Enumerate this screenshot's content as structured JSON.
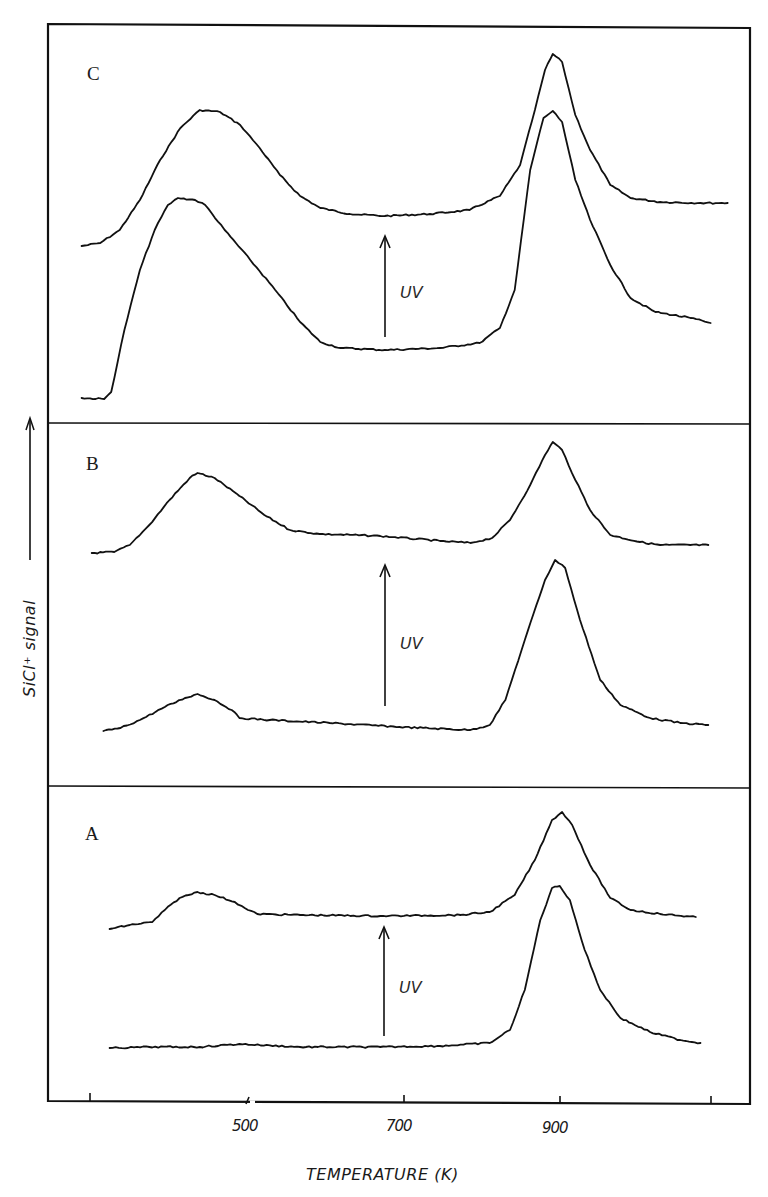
{
  "chart_data": {
    "type": "line",
    "title": "",
    "xlabel": "TEMPERATURE (K)",
    "ylabel": "SiCl⁺ signal",
    "ylabel_arrow": "up",
    "xlim": [
      250,
      1130
    ],
    "x_ticks": [
      300,
      500,
      700,
      900,
      1100
    ],
    "x_tick_labels": [
      "",
      "500",
      "700",
      "900",
      ""
    ],
    "x_axis_break_at": 500,
    "y_units": "arbitrary (offset traces, panel-relative)",
    "grid": false,
    "legend": null,
    "panels": [
      {
        "label": "C",
        "annotation": "UV",
        "annotation_arrow": {
          "T": 680,
          "from": 0.87,
          "to": 1.86
        },
        "series": [
          {
            "name": "C after UV (upper trace)",
            "points": [
              [
                286,
                1.77
              ],
              [
                310,
                1.8
              ],
              [
                335,
                1.93
              ],
              [
                361,
                2.23
              ],
              [
                387,
                2.63
              ],
              [
                413,
                2.95
              ],
              [
                438,
                3.13
              ],
              [
                464,
                3.11
              ],
              [
                490,
                2.98
              ],
              [
                515,
                2.75
              ],
              [
                541,
                2.48
              ],
              [
                567,
                2.27
              ],
              [
                593,
                2.15
              ],
              [
                631,
                2.09
              ],
              [
                676,
                2.07
              ],
              [
                734,
                2.09
              ],
              [
                785,
                2.13
              ],
              [
                824,
                2.27
              ],
              [
                850,
                2.58
              ],
              [
                869,
                3.13
              ],
              [
                882,
                3.53
              ],
              [
                892,
                3.69
              ],
              [
                904,
                3.61
              ],
              [
                921,
                3.08
              ],
              [
                940,
                2.73
              ],
              [
                966,
                2.38
              ],
              [
                992,
                2.25
              ],
              [
                1030,
                2.21
              ],
              [
                1082,
                2.2
              ],
              [
                1117,
                2.2
              ]
            ]
          },
          {
            "name": "C before UV (lower trace)",
            "points": [
              [
                286,
                0.25
              ],
              [
                315,
                0.24
              ],
              [
                324,
                0.31
              ],
              [
                341,
                0.93
              ],
              [
                361,
                1.53
              ],
              [
                380,
                1.93
              ],
              [
                397,
                2.18
              ],
              [
                410,
                2.25
              ],
              [
                432,
                2.23
              ],
              [
                445,
                2.18
              ],
              [
                470,
                1.93
              ],
              [
                503,
                1.63
              ],
              [
                535,
                1.33
              ],
              [
                567,
                1.01
              ],
              [
                593,
                0.81
              ],
              [
                619,
                0.75
              ],
              [
                676,
                0.73
              ],
              [
                747,
                0.75
              ],
              [
                798,
                0.8
              ],
              [
                824,
                0.95
              ],
              [
                843,
                1.33
              ],
              [
                863,
                2.53
              ],
              [
                880,
                3.05
              ],
              [
                892,
                3.12
              ],
              [
                904,
                3.01
              ],
              [
                921,
                2.43
              ],
              [
                940,
                2.03
              ],
              [
                966,
                1.58
              ],
              [
                992,
                1.25
              ],
              [
                1024,
                1.11
              ],
              [
                1069,
                1.05
              ],
              [
                1095,
                1.0
              ]
            ]
          }
        ]
      },
      {
        "label": "B",
        "annotation": "UV",
        "annotation_arrow": {
          "T": 680,
          "from": 0.81,
          "to": 2.22
        },
        "series": [
          {
            "name": "B after UV (upper trace)",
            "points": [
              [
                299,
                2.34
              ],
              [
                328,
                2.35
              ],
              [
                348,
                2.42
              ],
              [
                373,
                2.62
              ],
              [
                399,
                2.87
              ],
              [
                425,
                3.09
              ],
              [
                435,
                3.14
              ],
              [
                457,
                3.09
              ],
              [
                489,
                2.91
              ],
              [
                521,
                2.72
              ],
              [
                554,
                2.57
              ],
              [
                592,
                2.53
              ],
              [
                670,
                2.51
              ],
              [
                747,
                2.46
              ],
              [
                786,
                2.44
              ],
              [
                814,
                2.49
              ],
              [
                837,
                2.67
              ],
              [
                863,
                3.02
              ],
              [
                882,
                3.32
              ],
              [
                892,
                3.45
              ],
              [
                904,
                3.37
              ],
              [
                921,
                3.07
              ],
              [
                940,
                2.77
              ],
              [
                966,
                2.52
              ],
              [
                1004,
                2.45
              ],
              [
                1030,
                2.42
              ],
              [
                1092,
                2.42
              ]
            ]
          },
          {
            "name": "B before UV (lower trace)",
            "points": [
              [
                314,
                0.56
              ],
              [
                336,
                0.59
              ],
              [
                361,
                0.67
              ],
              [
                393,
                0.8
              ],
              [
                419,
                0.89
              ],
              [
                435,
                0.93
              ],
              [
                457,
                0.87
              ],
              [
                479,
                0.77
              ],
              [
                489,
                0.69
              ],
              [
                528,
                0.67
              ],
              [
                605,
                0.64
              ],
              [
                695,
                0.6
              ],
              [
                786,
                0.57
              ],
              [
                811,
                0.62
              ],
              [
                831,
                0.87
              ],
              [
                856,
                1.47
              ],
              [
                882,
                2.07
              ],
              [
                895,
                2.27
              ],
              [
                908,
                2.19
              ],
              [
                927,
                1.67
              ],
              [
                953,
                1.07
              ],
              [
                979,
                0.82
              ],
              [
                1017,
                0.69
              ],
              [
                1056,
                0.64
              ],
              [
                1092,
                0.62
              ]
            ]
          }
        ]
      },
      {
        "label": "A",
        "annotation": "UV",
        "annotation_arrow": {
          "T": 680,
          "from": 0.65,
          "to": 1.74
        },
        "series": [
          {
            "name": "A after UV (upper trace)",
            "points": [
              [
                322,
                1.72
              ],
              [
                348,
                1.76
              ],
              [
                377,
                1.79
              ],
              [
                393,
                1.91
              ],
              [
                412,
                2.03
              ],
              [
                435,
                2.09
              ],
              [
                457,
                2.06
              ],
              [
                483,
                1.99
              ],
              [
                500,
                1.91
              ],
              [
                512,
                1.87
              ],
              [
                567,
                1.86
              ],
              [
                670,
                1.85
              ],
              [
                773,
                1.86
              ],
              [
                811,
                1.89
              ],
              [
                843,
                2.06
              ],
              [
                869,
                2.41
              ],
              [
                891,
                2.81
              ],
              [
                904,
                2.89
              ],
              [
                917,
                2.76
              ],
              [
                940,
                2.36
              ],
              [
                966,
                2.03
              ],
              [
                992,
                1.91
              ],
              [
                1030,
                1.87
              ],
              [
                1076,
                1.84
              ]
            ]
          },
          {
            "name": "A before UV (lower trace)",
            "points": [
              [
                322,
                0.53
              ],
              [
                373,
                0.54
              ],
              [
                438,
                0.54
              ],
              [
                489,
                0.57
              ],
              [
                567,
                0.54
              ],
              [
                670,
                0.54
              ],
              [
                747,
                0.55
              ],
              [
                811,
                0.58
              ],
              [
                837,
                0.71
              ],
              [
                856,
                1.11
              ],
              [
                876,
                1.81
              ],
              [
                891,
                2.13
              ],
              [
                901,
                2.15
              ],
              [
                914,
                2.01
              ],
              [
                933,
                1.51
              ],
              [
                953,
                1.11
              ],
              [
                979,
                0.83
              ],
              [
                1017,
                0.69
              ],
              [
                1056,
                0.61
              ],
              [
                1082,
                0.58
              ]
            ]
          }
        ]
      }
    ]
  },
  "labels": {
    "panel_c": "C",
    "panel_b": "B",
    "panel_a": "A",
    "uv": "UV",
    "x_axis_title": "TEMPERATURE (K)",
    "y_axis_title": "SiCl⁺ signal",
    "tick_500": "500",
    "tick_700": "700",
    "tick_900": "900"
  },
  "colors": {
    "ink": "#111111",
    "background": "#ffffff"
  }
}
